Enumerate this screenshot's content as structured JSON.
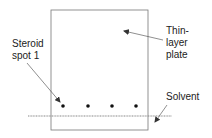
{
  "diagram": {
    "labels": {
      "steroid_line1": "Steroid",
      "steroid_line2": "spot 1",
      "plate_line1": "Thin-",
      "plate_line2": "layer",
      "plate_line3": "plate",
      "solvent": "Solvent"
    },
    "plate": {
      "x": 51,
      "y": 10,
      "width": 97,
      "height": 120
    },
    "spots": [
      {
        "x": 63,
        "y": 106
      },
      {
        "x": 88,
        "y": 106
      },
      {
        "x": 112,
        "y": 106
      },
      {
        "x": 136,
        "y": 106
      }
    ],
    "solvent_line_y": 116,
    "colors": {
      "stroke": "#333333",
      "solvent": "#888888",
      "text": "#222222",
      "background": "#ffffff"
    }
  }
}
